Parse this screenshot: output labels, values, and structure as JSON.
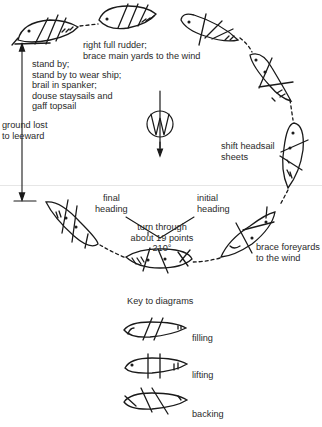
{
  "figure": {
    "type": "wearing-ship maneuver diagram",
    "wind_symbol": "wind-arrow-icon"
  },
  "labels": {
    "stand_by": [
      "stand by;",
      "stand by to wear ship;",
      "brail in spanker;",
      "douse staysails and",
      "gaff topsail"
    ],
    "rudder": [
      "right full rudder;",
      "brace main yards to the wind"
    ],
    "ground_lost": [
      "ground lost",
      "to leeward"
    ],
    "shift_headsail": [
      "shift headsail",
      "sheets"
    ],
    "brace_foreyards": [
      "brace foreyards",
      "to the wind"
    ],
    "final_heading": [
      "final",
      "heading"
    ],
    "initial_heading": [
      "initial",
      "heading"
    ],
    "turn": [
      "turn through",
      "about 19 points",
      "210°"
    ]
  },
  "key": {
    "title": "Key to diagrams",
    "items": [
      {
        "label": "filling"
      },
      {
        "label": "lifting"
      },
      {
        "label": "backing"
      }
    ]
  },
  "colors": {
    "ink": "#1a1a1a",
    "background": "#ffffff"
  }
}
